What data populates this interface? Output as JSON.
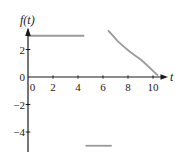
{
  "chart_data": {
    "type": "line",
    "title": "",
    "xlabel": "t",
    "ylabel": "f(t)",
    "xlim": [
      0,
      10.8
    ],
    "ylim": [
      -5.8,
      3.6
    ],
    "grid": false,
    "legend": false,
    "axis_color": "#1a1a1a",
    "curve_color": "#9a9a9a",
    "x_ticks": [
      {
        "label": "0",
        "value": 0
      },
      {
        "label": "2",
        "value": 2
      },
      {
        "label": "4",
        "value": 4
      },
      {
        "label": "6",
        "value": 6
      },
      {
        "label": "8",
        "value": 8
      },
      {
        "label": "10",
        "value": 10
      }
    ],
    "y_ticks": [
      {
        "label": "2",
        "value": 2
      },
      {
        "label": "0",
        "value": 0
      },
      {
        "label": "−2",
        "value": -2
      },
      {
        "label": "−4",
        "value": -4
      }
    ],
    "series": [
      {
        "name": "constant-segment-high",
        "type": "hsegment",
        "y": 3,
        "x_start": 0,
        "x_end": 4.5
      },
      {
        "name": "decay-curve",
        "type": "curve",
        "points": [
          [
            6.4,
            3.4
          ],
          [
            7.2,
            2.6
          ],
          [
            8.2,
            1.8
          ],
          [
            9.1,
            1.2
          ],
          [
            10.4,
            0.1
          ]
        ]
      },
      {
        "name": "constant-segment-low",
        "type": "hsegment",
        "y": -5,
        "x_start": 4.6,
        "x_end": 6.7
      }
    ]
  }
}
